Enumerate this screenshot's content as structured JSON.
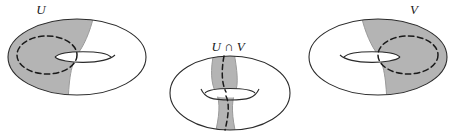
{
  "figure": {
    "background_color": "#ffffff",
    "width": 456,
    "height": 136,
    "stroke_color": "#2b2b2b",
    "shaded_color": "#b4b4b4",
    "shaded_edge_color": "#9a9a9a",
    "dashed_color": "#1a1a1a"
  },
  "labels": {
    "left": "U",
    "middle": "U ∩ V",
    "right": "V"
  },
  "panels": [
    {
      "id": "torus-u",
      "label": "U",
      "label_x": 41,
      "label_y": 14,
      "description": "Torus with left-hand open region U shaded gray, dashed generating circle drawn on the shaded part",
      "center_x": 77,
      "center_y": 57,
      "outer_rx": 69,
      "outer_ry": 38,
      "hole_cx": 83,
      "hole_cy": 57,
      "hole_rx": 28,
      "hole_ry": 7,
      "shading_side": "left",
      "dashed_curve": "ellipse",
      "dashed_cx": 47,
      "dashed_cy": 55,
      "dashed_rx": 30,
      "dashed_ry": 19
    },
    {
      "id": "torus-u-cap-v",
      "label": "U ∩ V",
      "label_x": 228,
      "label_y": 51,
      "description": "Torus with a narrow vertical annular band U intersect V shaded gray, dashed meridian circle running through it",
      "center_x": 230,
      "center_y": 93,
      "outer_rx": 60,
      "outer_ry": 37,
      "hole_cx": 230,
      "hole_cy": 93,
      "hole_rx": 25,
      "hole_ry": 6,
      "shading_side": "band",
      "band_left": 212,
      "band_right": 233,
      "dashed_curve": "meridian"
    },
    {
      "id": "torus-v",
      "label": "V",
      "label_x": 414,
      "label_y": 14,
      "description": "Torus with right-hand open region V shaded gray, dashed generating circle drawn on the shaded part",
      "center_x": 378,
      "center_y": 57,
      "outer_rx": 69,
      "outer_ry": 38,
      "hole_cx": 372,
      "hole_cy": 57,
      "hole_rx": 28,
      "hole_ry": 7,
      "shading_side": "right",
      "dashed_curve": "ellipse",
      "dashed_cx": 408,
      "dashed_cy": 55,
      "dashed_rx": 30,
      "dashed_ry": 19
    }
  ]
}
